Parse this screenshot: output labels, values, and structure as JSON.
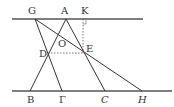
{
  "diagram": {
    "type": "geometry",
    "lines": {
      "top_parallel": {
        "from": [
          12,
          19
        ],
        "to": [
          143,
          19
        ]
      },
      "bottom_parallel": {
        "from": [
          12,
          91
        ],
        "to": [
          172,
          91
        ]
      }
    },
    "points": {
      "G": {
        "label": "G",
        "x": 35,
        "y": 19
      },
      "A": {
        "label": "Α",
        "x": 66,
        "y": 19
      },
      "K": {
        "label": "K",
        "x": 82,
        "y": 19
      },
      "O": {
        "label": "O",
        "x": 64,
        "y": 40
      },
      "D": {
        "label": "D",
        "x": 48,
        "y": 53
      },
      "E": {
        "label": "E",
        "x": 85,
        "y": 53
      },
      "B": {
        "label": "B",
        "x": 30,
        "y": 91
      },
      "Gamma": {
        "label": "Γ",
        "x": 62,
        "y": 91
      },
      "C": {
        "label": "C",
        "x": 105,
        "y": 91
      },
      "H": {
        "label": "H",
        "x": 142,
        "y": 91
      }
    },
    "segments": [
      "GΓ",
      "GH",
      "AB",
      "AC"
    ],
    "dashed_segments": [
      "DE",
      "KE"
    ],
    "right_angle_at": "K"
  }
}
